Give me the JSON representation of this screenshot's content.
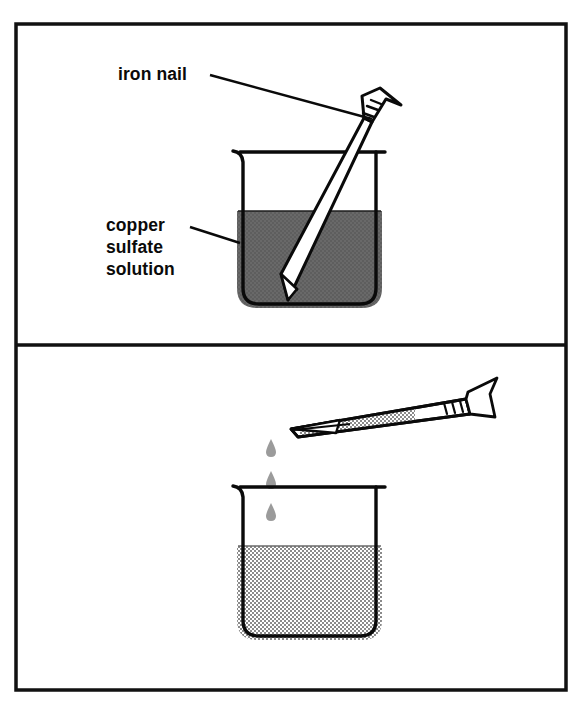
{
  "figure": {
    "border_color": "#111111",
    "background_color": "#ffffff"
  },
  "panels": [
    {
      "id": "panel-top",
      "name": "before-reaction",
      "labels": [
        {
          "id": "label-iron-nail",
          "name": "iron-nail-label",
          "lines": [
            "iron nail"
          ],
          "target": "nail-head-top"
        },
        {
          "id": "label-copper-sulfate",
          "name": "copper-sulfate-solution-label",
          "lines": [
            "copper",
            "sulfate",
            "solution"
          ],
          "target": "beaker-top-liquid"
        }
      ],
      "beaker": {
        "name": "beaker-top",
        "liquid_color": "#636363",
        "liquid_label": "copper sulfate solution",
        "outline_color": "#0a0a0a",
        "has_spout": true
      },
      "nail": {
        "name": "nail-top",
        "orientation": "diagonal-submerged",
        "body_color": "#ffffff",
        "outline_color": "#0a0a0a",
        "head_ridges": 3
      }
    },
    {
      "id": "panel-bottom",
      "name": "after-reaction",
      "labels": [],
      "beaker": {
        "name": "beaker-bottom",
        "liquid_color": "#9b9b9b",
        "liquid_label": "faded solution",
        "outline_color": "#0a0a0a",
        "has_spout": true
      },
      "nail": {
        "name": "nail-bottom",
        "orientation": "horizontal-tilted",
        "body_color": "#ffffff",
        "coating_color": "#9b9b9b",
        "coating_label": "copper deposit",
        "outline_color": "#0a0a0a",
        "head_ridges": 3
      },
      "droplets": {
        "name": "falling-droplets",
        "count": 3,
        "color": "#9b9b9b"
      }
    }
  ]
}
